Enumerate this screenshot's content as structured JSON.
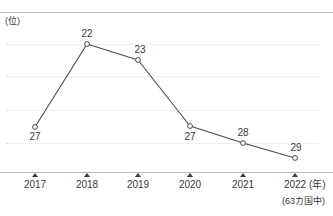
{
  "chart_data": {
    "type": "line",
    "title": "",
    "subtitle": "",
    "xlabel": "(年)",
    "ylabel": "(位)",
    "categories": [
      "2017",
      "2018",
      "2019",
      "2020",
      "2021",
      "2022"
    ],
    "values": [
      27,
      22,
      23,
      27,
      28,
      29
    ],
    "series": [
      {
        "name": "順位",
        "values": [
          27,
          22,
          23,
          27,
          28,
          29
        ]
      }
    ],
    "point_labels": [
      "27",
      "22",
      "23",
      "27",
      "28",
      "29"
    ],
    "point_label_positions": [
      "below",
      "above",
      "above",
      "below",
      "above",
      "above"
    ],
    "y_inverted": true,
    "ylim": [
      31,
      21
    ],
    "grid": true,
    "gridline_values": [
      22,
      24,
      26,
      28
    ],
    "legend": "none",
    "annotation": "(63カ国中)",
    "marker": "open-circle",
    "line_color": "#4a4a4a",
    "marker_color": "#ffffff",
    "marker_edge_color": "#4a4a4a",
    "grid_color": "#e2e2e4",
    "axis_color": "#b9bcbe",
    "text_color": "#3a3a3a",
    "background": "#ffffff"
  },
  "axis": {
    "y_unit_label": "(位)",
    "x_unit_label": "(年)",
    "ticks": [
      {
        "label": "2017",
        "x": 35
      },
      {
        "label": "2018",
        "x": 87
      },
      {
        "label": "2019",
        "x": 138
      },
      {
        "label": "2020",
        "x": 190
      },
      {
        "label": "2021",
        "x": 243
      },
      {
        "label": "2022",
        "x": 295
      }
    ]
  },
  "points": [
    {
      "year": "2017",
      "value": "27",
      "x": 35,
      "y": 127,
      "label_x": 35,
      "label_y": 131,
      "label_pos": "below"
    },
    {
      "year": "2018",
      "value": "22",
      "x": 87,
      "y": 44,
      "label_x": 87,
      "label_y": 28,
      "label_pos": "above"
    },
    {
      "year": "2019",
      "value": "23",
      "x": 138,
      "y": 60,
      "label_x": 140,
      "label_y": 44,
      "label_pos": "above"
    },
    {
      "year": "2020",
      "value": "27",
      "x": 190,
      "y": 126,
      "label_x": 190,
      "label_y": 131,
      "label_pos": "below"
    },
    {
      "year": "2021",
      "value": "28",
      "x": 243,
      "y": 143,
      "label_x": 243,
      "label_y": 127,
      "label_pos": "above"
    },
    {
      "year": "2022",
      "value": "29",
      "x": 295,
      "y": 158,
      "label_x": 296,
      "label_y": 142,
      "label_pos": "above"
    }
  ],
  "gridlines": [
    {
      "y": 44
    },
    {
      "y": 76
    },
    {
      "y": 110
    },
    {
      "y": 143
    }
  ],
  "footnote": "(63カ国中)"
}
